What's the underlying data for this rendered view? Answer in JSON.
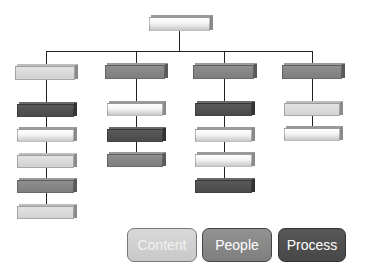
{
  "diagram": {
    "root": {
      "color": "white"
    },
    "columns": [
      {
        "head": {
          "color": "light"
        },
        "children": [
          "dark",
          "white",
          "light",
          "med",
          "light"
        ]
      },
      {
        "head": {
          "color": "med"
        },
        "children": [
          "white",
          "dark",
          "med"
        ]
      },
      {
        "head": {
          "color": "med"
        },
        "children": [
          "dark",
          "white",
          "white",
          "dark"
        ]
      },
      {
        "head": {
          "color": "med"
        },
        "children": [
          "light",
          "white"
        ]
      }
    ]
  },
  "legend": {
    "items": [
      {
        "label": "Content",
        "color": "#cfcfcf",
        "text_color": "#f2f2f2"
      },
      {
        "label": "People",
        "color": "#8a8a8a",
        "text_color": "#ffffff"
      },
      {
        "label": "Process",
        "color": "#4e4e4e",
        "text_color": "#ffffff"
      }
    ]
  },
  "colors": {
    "dark": "#525252",
    "med": "#868686",
    "light": "#dadada",
    "white": "#f6f6f6",
    "connector": "#222222"
  }
}
